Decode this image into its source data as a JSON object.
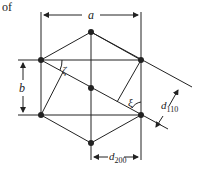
{
  "text_fragment": "of",
  "labels": {
    "a": "a",
    "b": "b",
    "zeta": "ζ",
    "xi": "ξ",
    "d110_main": "d",
    "d110_sub": "110",
    "d200_main": "d",
    "d200_sub": "200"
  },
  "colors": {
    "line": "#222222",
    "background": "#ffffff"
  },
  "points": {
    "top": [
      91,
      32
    ],
    "upper_left": [
      41,
      60
    ],
    "upper_right": [
      141,
      60
    ],
    "center": [
      91,
      88
    ],
    "lower_left": [
      41,
      115
    ],
    "lower_right": [
      141,
      115
    ],
    "bottom": [
      91,
      143
    ]
  }
}
